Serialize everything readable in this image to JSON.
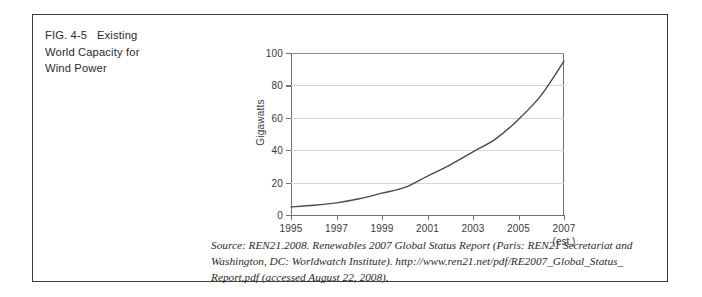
{
  "figure": {
    "caption_lines": [
      "FIG. 4-5   Existing",
      "World Capacity for",
      "Wind Power"
    ],
    "caption_full": "FIG. 4-5 Existing World Capacity for Wind Power",
    "border_color": "#3d3d3d",
    "background": "#ffffff"
  },
  "source": {
    "lines": [
      "Source: REN21.2008. Renewables 2007 Global Status Report (Paris: REN21 Secretariat and",
      "Washington, DC: Worldwatch Institute). http://www.ren21.net/pdf/RE2007_Global_Status_",
      "Report.pdf (accessed August 22, 2008)."
    ]
  },
  "chart_data": {
    "type": "line",
    "title": "",
    "xlabel": "",
    "ylabel": "Gigawatts",
    "x": [
      1995,
      1996,
      1997,
      1998,
      1999,
      2000,
      2001,
      2002,
      2003,
      2004,
      2005,
      2006,
      2007
    ],
    "values": [
      5,
      6,
      7.5,
      10,
      13.5,
      17,
      24,
      31,
      39,
      47,
      59,
      74,
      95
    ],
    "xlim": [
      1995,
      2007
    ],
    "ylim": [
      0,
      100
    ],
    "y_ticks": [
      0,
      20,
      40,
      60,
      80,
      100
    ],
    "y_tick_labels": [
      "0",
      "20",
      "40",
      "60",
      "80",
      "100"
    ],
    "x_ticks": [
      1995,
      1997,
      1999,
      2001,
      2003,
      2005,
      2007
    ],
    "x_tick_labels": [
      "1995",
      "1997",
      "1999",
      "2001",
      "2003",
      "2005",
      "2007"
    ],
    "x_annotation": "(est.)",
    "x_annotation_at": 2007,
    "grid": true,
    "grid_color": "#d6d6d6",
    "axis_color": "#6f6f6f",
    "line_color": "#4a4a4a",
    "line_width": 1.4,
    "legend": null,
    "series": [
      {
        "name": "World wind power capacity",
        "values": [
          5,
          6,
          7.5,
          10,
          13.5,
          17,
          24,
          31,
          39,
          47,
          59,
          74,
          95
        ]
      }
    ]
  }
}
